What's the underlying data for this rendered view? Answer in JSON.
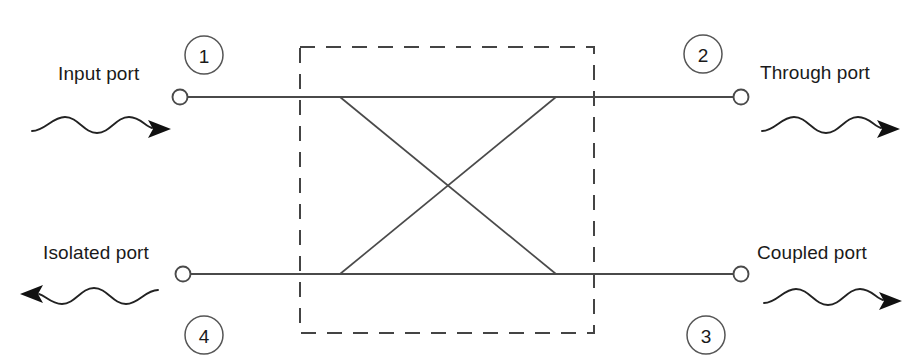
{
  "figure": {
    "kind": "directional-coupler-schematic",
    "width": 917,
    "height": 364,
    "background_color": "#ffffff",
    "line_color": "#4a4a4a",
    "text_color": "#1a1a1a",
    "dashed_box_color": "#444444"
  },
  "ports": {
    "input": {
      "number": "1",
      "label": "Input port",
      "wave_direction": "right"
    },
    "through": {
      "number": "2",
      "label": "Through port",
      "wave_direction": "right"
    },
    "coupled": {
      "number": "3",
      "label": "Coupled port",
      "wave_direction": "right"
    },
    "isolated": {
      "number": "4",
      "label": "Isolated port",
      "wave_direction": "left"
    }
  }
}
